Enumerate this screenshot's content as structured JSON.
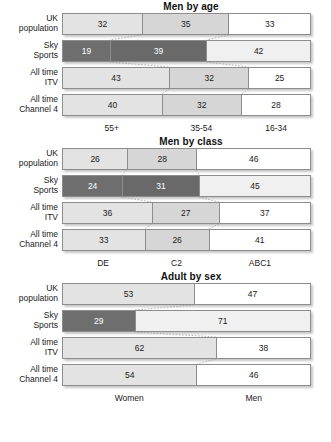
{
  "charts": [
    {
      "title": "Men by age",
      "axis_labels": [
        "55+",
        "35-54",
        "16-34"
      ],
      "rows": [
        {
          "label_lines": [
            "UK",
            "population"
          ],
          "name": "uk-population",
          "values": [
            32,
            35,
            33
          ],
          "shades": [
            "light",
            "mid",
            "white"
          ]
        },
        {
          "label_lines": [
            "Sky",
            "Sports"
          ],
          "name": "sky-sports",
          "values": [
            19,
            39,
            42
          ],
          "shades": [
            "dark",
            "dark2",
            "pale"
          ]
        },
        {
          "label_lines": [
            "All time",
            "ITV"
          ],
          "name": "all-time-itv",
          "values": [
            43,
            32,
            25
          ],
          "shades": [
            "light",
            "mid",
            "white"
          ]
        },
        {
          "label_lines": [
            "All time",
            "Channel 4"
          ],
          "name": "all-time-channel-4",
          "values": [
            40,
            32,
            28
          ],
          "shades": [
            "light",
            "mid",
            "white"
          ]
        }
      ]
    },
    {
      "title": "Men by class",
      "axis_labels": [
        "DE",
        "C2",
        "ABC1"
      ],
      "rows": [
        {
          "label_lines": [
            "UK",
            "population"
          ],
          "name": "uk-population",
          "values": [
            26,
            28,
            46
          ],
          "shades": [
            "light",
            "mid",
            "white"
          ]
        },
        {
          "label_lines": [
            "Sky",
            "Sports"
          ],
          "name": "sky-sports",
          "values": [
            24,
            31,
            45
          ],
          "shades": [
            "dark",
            "dark2",
            "pale"
          ]
        },
        {
          "label_lines": [
            "All time",
            "ITV"
          ],
          "name": "all-time-itv",
          "values": [
            36,
            27,
            37
          ],
          "shades": [
            "light",
            "mid",
            "white"
          ]
        },
        {
          "label_lines": [
            "All time",
            "Channel 4"
          ],
          "name": "all-time-channel-4",
          "values": [
            33,
            26,
            41
          ],
          "shades": [
            "light",
            "mid",
            "white"
          ]
        }
      ]
    },
    {
      "title": "Adult by sex",
      "axis_labels": [
        "Women",
        "Men"
      ],
      "rows": [
        {
          "label_lines": [
            "UK",
            "population"
          ],
          "name": "uk-population",
          "values": [
            53,
            47
          ],
          "shades": [
            "light",
            "white"
          ]
        },
        {
          "label_lines": [
            "Sky",
            "Sports"
          ],
          "name": "sky-sports",
          "values": [
            29,
            71
          ],
          "shades": [
            "dark",
            "pale"
          ]
        },
        {
          "label_lines": [
            "All time",
            "ITV"
          ],
          "name": "all-time-itv",
          "values": [
            62,
            38
          ],
          "shades": [
            "light",
            "white"
          ]
        },
        {
          "label_lines": [
            "All time",
            "Channel 4"
          ],
          "name": "all-time-channel-4",
          "values": [
            54,
            46
          ],
          "shades": [
            "light",
            "white"
          ]
        }
      ]
    }
  ],
  "chart_data": [
    {
      "type": "bar",
      "orientation": "horizontal",
      "stacked": true,
      "normalized": true,
      "title": "Men by age",
      "xlabel": "",
      "ylabel": "",
      "xlim": [
        0,
        100
      ],
      "grid": false,
      "legend": "bottom-axis-labels",
      "categories": [
        "UK population",
        "Sky Sports",
        "All time ITV",
        "All time Channel 4"
      ],
      "series": [
        {
          "name": "55+",
          "values": [
            32,
            19,
            43,
            40
          ]
        },
        {
          "name": "35-54",
          "values": [
            35,
            39,
            32,
            32
          ]
        },
        {
          "name": "16-34",
          "values": [
            33,
            42,
            25,
            28
          ]
        }
      ]
    },
    {
      "type": "bar",
      "orientation": "horizontal",
      "stacked": true,
      "normalized": true,
      "title": "Men by class",
      "xlabel": "",
      "ylabel": "",
      "xlim": [
        0,
        100
      ],
      "grid": false,
      "legend": "bottom-axis-labels",
      "categories": [
        "UK population",
        "Sky Sports",
        "All time ITV",
        "All time Channel 4"
      ],
      "series": [
        {
          "name": "DE",
          "values": [
            26,
            24,
            36,
            33
          ]
        },
        {
          "name": "C2",
          "values": [
            28,
            31,
            27,
            26
          ]
        },
        {
          "name": "ABC1",
          "values": [
            46,
            45,
            37,
            41
          ]
        }
      ]
    },
    {
      "type": "bar",
      "orientation": "horizontal",
      "stacked": true,
      "normalized": true,
      "title": "Adult by sex",
      "xlabel": "",
      "ylabel": "",
      "xlim": [
        0,
        100
      ],
      "grid": false,
      "legend": "bottom-axis-labels",
      "categories": [
        "UK population",
        "Sky Sports",
        "All time ITV",
        "All time Channel 4"
      ],
      "series": [
        {
          "name": "Women",
          "values": [
            53,
            29,
            62,
            54
          ]
        },
        {
          "name": "Men",
          "values": [
            47,
            71,
            38,
            46
          ]
        }
      ]
    }
  ],
  "colors": {
    "segment_light": "#e3e3e3",
    "segment_mid": "#d6d6d6",
    "segment_white": "#ffffff",
    "segment_dark": "#6e6e6e",
    "segment_pale": "#f0f0f0",
    "border": "#8d8d8d",
    "text": "#1a1a1a",
    "background": "#ffffff"
  }
}
